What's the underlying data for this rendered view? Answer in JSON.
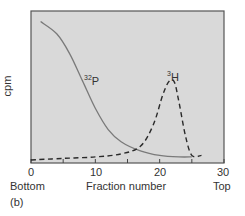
{
  "chart_data": {
    "type": "line",
    "title": "",
    "panel_label": "(b)",
    "xlabel": "Fraction number",
    "ylabel": "cpm",
    "x_left_label": "Bottom",
    "x_right_label": "Top",
    "xlim": [
      0,
      30
    ],
    "ylim": [
      0,
      100
    ],
    "x_ticks": [
      0,
      10,
      20,
      30
    ],
    "x_minor_ticks": [
      5,
      15,
      25
    ],
    "y_ticks": [],
    "grid": false,
    "legend": "inline labels",
    "background": "#d9d9d9",
    "series": [
      {
        "name": "32P",
        "label_sup": "32",
        "label_main": "P",
        "style": "solid",
        "color": "#7a7a7a",
        "x": [
          1.5,
          4,
          6,
          8,
          10,
          12,
          14,
          17,
          20,
          23,
          25
        ],
        "y": [
          93,
          85,
          72,
          54,
          36,
          22,
          14,
          8,
          5,
          4,
          4
        ]
      },
      {
        "name": "3H",
        "label_sup": "3",
        "label_main": "H",
        "style": "dashed",
        "color": "#2a2a2a",
        "x": [
          0,
          5,
          10,
          14,
          17,
          19,
          20.5,
          21.5,
          22.3,
          23,
          24,
          25,
          26.5
        ],
        "y": [
          2,
          3,
          4,
          6,
          11,
          25,
          45,
          54,
          53,
          40,
          18,
          5,
          5
        ]
      }
    ]
  }
}
